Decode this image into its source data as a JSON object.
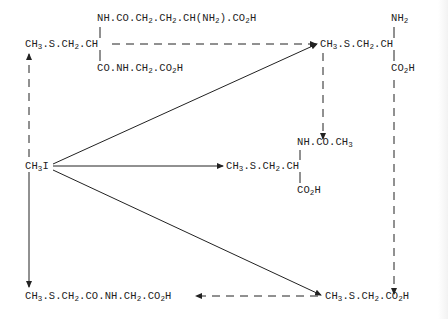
{
  "diagram": {
    "type": "metabolic-pathway",
    "nodes": {
      "glutathione_conjugate": {
        "top": "NH.CO.CH2.CH2.CH(NH2).CO2H",
        "main": "CH3.S.CH2.CH",
        "bottom": "CO.NH.CH2.CO2H"
      },
      "s_methylcysteine": {
        "top": "NH2",
        "main": "CH3.S.CH2.CH",
        "bottom": "CO2H"
      },
      "methyl_iodide": {
        "main": "CH3I"
      },
      "mercapturic_acid": {
        "top": "NH.CO.CH3",
        "main": "CH3.S.CH2.CH",
        "bottom": "CO2H"
      },
      "methylthioacetylglycine": {
        "main": "CH3.S.CH2.CO.NH.CH2.CO2H"
      },
      "methylthioacetic_acid": {
        "main": "CH3.S.CH2.CO2H"
      }
    },
    "edges": [
      {
        "from": "methyl_iodide",
        "to": "glutathione_conjugate",
        "style": "dashed"
      },
      {
        "from": "methyl_iodide",
        "to": "methylthioacetylglycine",
        "style": "solid"
      },
      {
        "from": "methyl_iodide",
        "to": "s_methylcysteine",
        "style": "solid"
      },
      {
        "from": "methyl_iodide",
        "to": "mercapturic_acid",
        "style": "solid"
      },
      {
        "from": "methyl_iodide",
        "to": "methylthioacetic_acid",
        "style": "solid"
      },
      {
        "from": "glutathione_conjugate",
        "to": "s_methylcysteine",
        "style": "dashed"
      },
      {
        "from": "s_methylcysteine",
        "to": "mercapturic_acid",
        "style": "dashed"
      },
      {
        "from": "s_methylcysteine",
        "to": "methylthioacetic_acid",
        "style": "dashed"
      },
      {
        "from": "methylthioacetic_acid",
        "to": "methylthioacetylglycine",
        "style": "dashed"
      }
    ]
  }
}
